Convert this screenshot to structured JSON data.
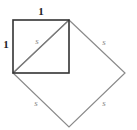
{
  "diagram": {
    "labels": {
      "top_side": "1",
      "left_side": "1",
      "diagonal": "s",
      "big_upper_right": "s",
      "big_lower_left": "s",
      "big_lower_right": "s"
    },
    "colors": {
      "unit_square": "#333333",
      "big_square": "#888888",
      "labels_dark": "#222222",
      "labels_s": "#888888"
    }
  }
}
